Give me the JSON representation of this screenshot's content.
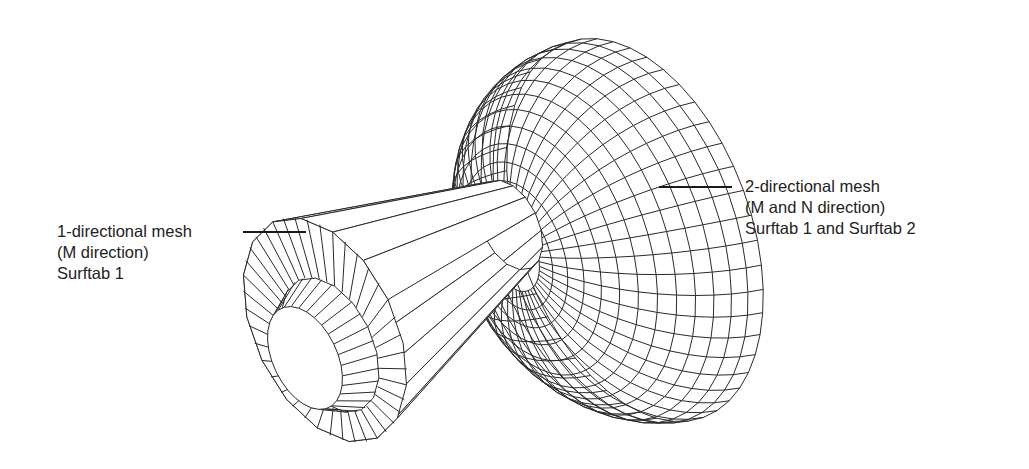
{
  "figure": {
    "line_color": "#2a2a2a",
    "background": "#ffffff"
  },
  "labels": {
    "left": {
      "line1": "1-directional mesh",
      "line2": "(M direction)",
      "line3": "Surftab 1"
    },
    "right": {
      "line1": "2-directional mesh",
      "line2": "(M and N direction)",
      "line3": "Surftab 1 and Surftab 2"
    }
  }
}
